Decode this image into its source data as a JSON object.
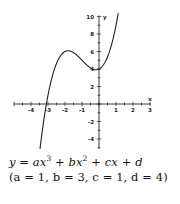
{
  "chart_data": {
    "type": "line",
    "title": "",
    "xlabel": "x",
    "ylabel": "y",
    "xlim": [
      -5,
      3
    ],
    "ylim": [
      -5,
      10
    ],
    "x_ticks": [
      -4,
      -3,
      -2,
      -1,
      1,
      2,
      3
    ],
    "y_ticks": [
      -4,
      -2,
      2,
      4,
      6,
      8,
      10
    ],
    "grid": false,
    "legend": null,
    "series": [
      {
        "name": "y = x^3 + 3x^2 + x + 4",
        "function": "x^3 + 3x^2 + x + 4",
        "x": [
          -3.4,
          -3.0,
          -2.5,
          -2.0,
          -1.816,
          -1.5,
          -1.0,
          -0.5,
          -0.184,
          0.0,
          0.5,
          1.0,
          1.2
        ],
        "values": [
          -2.2,
          1.0,
          3.69,
          5.0,
          5.09,
          4.87,
          5.0,
          4.12,
          3.91,
          4.0,
          5.38,
          9.0,
          11.2
        ]
      }
    ],
    "caption": {
      "line1": "y = ax^3 + bx^2 + cx + d",
      "line2": "(a = 1, b = 3, c = 1, d = 4)"
    }
  },
  "equation": {
    "line1": {
      "y": "y",
      "eq": " = ",
      "a": "a",
      "x1": "x",
      "exp3": "3",
      "plus1": " + ",
      "b": "b",
      "x2": "x",
      "exp2": "2",
      "plus2": " + ",
      "c": "c",
      "x3": "x",
      "plus3": " + ",
      "d": "d"
    },
    "line2": "(a = 1, b = 3, c = 1, d = 4)"
  },
  "colors": {
    "axis": "#222222",
    "curve": "#222222",
    "text": "#111111"
  }
}
